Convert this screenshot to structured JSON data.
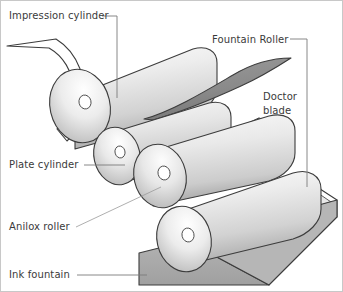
{
  "diagram": {
    "background_color": "#ffffff",
    "border_color": "#c8c8c8",
    "text_color": "#3a3a3a",
    "leader_color": "#7a7a7a",
    "outline_color": "#3c3c3c",
    "labels": [
      {
        "id": "impression-cylinder",
        "text": "Impression cylinder",
        "x": 8,
        "y": 18,
        "anchor": "start"
      },
      {
        "id": "fountain-roller",
        "text": "Fountain Roller",
        "x": 211,
        "y": 42,
        "anchor": "start"
      },
      {
        "id": "doctor-blade-line1",
        "text": "Doctor",
        "x": 262,
        "y": 99,
        "anchor": "start"
      },
      {
        "id": "doctor-blade-line2",
        "text": "blade",
        "x": 262,
        "y": 113,
        "anchor": "start"
      },
      {
        "id": "plate-cylinder",
        "text": "Plate cylinder",
        "x": 8,
        "y": 167,
        "anchor": "start"
      },
      {
        "id": "anilox-roller",
        "text": "Anilox roller",
        "x": 8,
        "y": 229,
        "anchor": "start"
      },
      {
        "id": "ink-fountain",
        "text": "Ink fountain",
        "x": 8,
        "y": 277,
        "anchor": "start"
      }
    ],
    "parts": [
      {
        "id": "web-substrate",
        "name": "web substrate",
        "color": "#ffffff"
      },
      {
        "id": "impression-cylinder",
        "name": "impression cylinder",
        "color": "#e6e6e6"
      },
      {
        "id": "plate-cylinder",
        "name": "plate cylinder",
        "color": "#e2e2e2"
      },
      {
        "id": "anilox-roller",
        "name": "anilox roller",
        "color": "#e0e0e0"
      },
      {
        "id": "fountain-roller",
        "name": "fountain roller",
        "color": "#dedede"
      },
      {
        "id": "doctor-blade",
        "name": "doctor blade",
        "color": "#8c8c8c"
      },
      {
        "id": "blade-holder",
        "name": "blade holder",
        "color": "#d5d5d5"
      },
      {
        "id": "ink-fountain",
        "name": "ink fountain",
        "color": "#a8a8a8"
      }
    ]
  }
}
